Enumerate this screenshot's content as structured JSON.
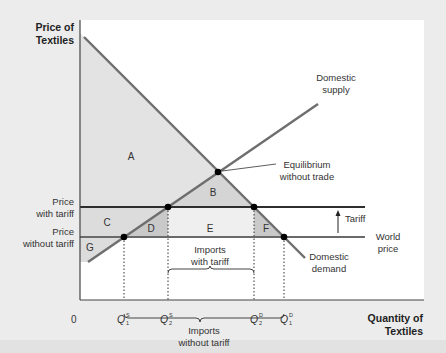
{
  "diagram": {
    "type": "tariff-supply-demand",
    "colors": {
      "background": "#ececec",
      "plot_background": "#ffffff",
      "shade_dark": "#d3d3d3",
      "shade_light": "#efefef",
      "line": "#6e6e6e",
      "price_line": "#3a3a3a",
      "point": "#000000"
    },
    "axes": {
      "y_label_line1": "Price of",
      "y_label_line2": "Textiles",
      "x_label_line1": "Quantity of",
      "x_label_line2": "Textiles",
      "origin": "0"
    },
    "curves": {
      "supply_line1": "Domestic",
      "supply_line2": "supply",
      "demand_line1": "Domestic",
      "demand_line2": "demand"
    },
    "price_levels": {
      "with_tariff_line1": "Price",
      "with_tariff_line2": "with tariff",
      "without_tariff_line1": "Price",
      "without_tariff_line2": "without tariff",
      "world_line1": "World",
      "world_line2": "price",
      "tariff": "Tariff"
    },
    "equilibrium": {
      "line1": "Equilibrium",
      "line2": "without trade"
    },
    "areas": {
      "A": "A",
      "B": "B",
      "C": "C",
      "D": "D",
      "E": "E",
      "F": "F",
      "G": "G"
    },
    "quantities": [
      {
        "base": "Q",
        "sub": "1",
        "sup": "S"
      },
      {
        "base": "Q",
        "sub": "2",
        "sup": "S"
      },
      {
        "base": "Q",
        "sub": "2",
        "sup": "D"
      },
      {
        "base": "Q",
        "sub": "1",
        "sup": "D"
      }
    ],
    "braces": {
      "with_tariff_line1": "Imports",
      "with_tariff_line2": "with tariff",
      "without_tariff_line1": "Imports",
      "without_tariff_line2": "without tariff"
    }
  }
}
